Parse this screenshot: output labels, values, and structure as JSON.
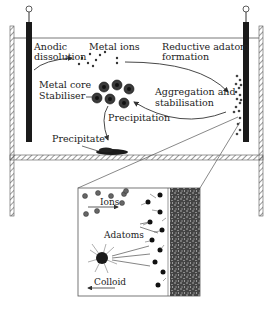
{
  "diagram": {
    "labels": {
      "anodic_dissolution_line1": "Anodic",
      "anodic_dissolution_line2": "dissolution",
      "metal_ions": "Metal ions",
      "reductive_line1": "Reductive adatom",
      "reductive_line2": "formation",
      "metal_core": "Metal core",
      "stabiliser": "Stabiliser",
      "aggregation_line1": "Aggregation and",
      "aggregation_line2": "stabilisation",
      "precipitation": "Precipitation",
      "precipitate": "Precipitate"
    },
    "inset": {
      "ions": "Ions",
      "adatoms": "Adatoms",
      "colloid": "Colloid"
    },
    "colors": {
      "electrode": "#1a1a1a",
      "line": "#333333",
      "hatch": "#555555",
      "background": "#ffffff"
    }
  }
}
